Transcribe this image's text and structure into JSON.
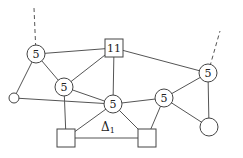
{
  "diagram": {
    "type": "planar-graph",
    "nodes": [
      {
        "id": "n_tl",
        "shape": "circle",
        "size": "labeled",
        "label": "5"
      },
      {
        "id": "n_top",
        "shape": "square",
        "size": "labeled",
        "label": "11"
      },
      {
        "id": "n_fl",
        "shape": "circle",
        "size": "small",
        "label": ""
      },
      {
        "id": "n_lm",
        "shape": "circle",
        "size": "labeled",
        "label": "5"
      },
      {
        "id": "n_c",
        "shape": "circle",
        "size": "labeled",
        "label": "5"
      },
      {
        "id": "n_rc",
        "shape": "circle",
        "size": "labeled",
        "label": "5"
      },
      {
        "id": "n_fr",
        "shape": "circle",
        "size": "labeled",
        "label": "5"
      },
      {
        "id": "n_br",
        "shape": "circle",
        "size": "large",
        "label": ""
      },
      {
        "id": "n_bl",
        "shape": "square",
        "size": "large",
        "label": ""
      },
      {
        "id": "n_bm",
        "shape": "square",
        "size": "large",
        "label": ""
      }
    ],
    "edges": [
      {
        "from": "n_tl",
        "to": "n_top",
        "style": "solid"
      },
      {
        "from": "n_tl",
        "to": "n_fl",
        "style": "solid"
      },
      {
        "from": "n_tl",
        "to": "n_lm",
        "style": "solid"
      },
      {
        "from": "n_top",
        "to": "n_lm",
        "style": "solid"
      },
      {
        "from": "n_top",
        "to": "n_c",
        "style": "solid"
      },
      {
        "from": "n_top",
        "to": "n_fr",
        "style": "solid"
      },
      {
        "from": "n_fl",
        "to": "n_c",
        "style": "solid"
      },
      {
        "from": "n_lm",
        "to": "n_c",
        "style": "solid"
      },
      {
        "from": "n_lm",
        "to": "n_bl",
        "style": "solid"
      },
      {
        "from": "n_c",
        "to": "n_rc",
        "style": "solid"
      },
      {
        "from": "n_c",
        "to": "n_bl",
        "style": "solid"
      },
      {
        "from": "n_c",
        "to": "n_bm",
        "style": "solid"
      },
      {
        "from": "n_rc",
        "to": "n_fr",
        "style": "solid"
      },
      {
        "from": "n_rc",
        "to": "n_br",
        "style": "solid"
      },
      {
        "from": "n_rc",
        "to": "n_bm",
        "style": "solid"
      },
      {
        "from": "n_fr",
        "to": "n_br",
        "style": "solid"
      },
      {
        "from": "n_bl",
        "to": "n_bm",
        "style": "solid"
      }
    ],
    "dangling_edges": [
      {
        "from": "n_tl",
        "direction": "up",
        "style": "dashed"
      },
      {
        "from": "n_fr",
        "direction": "up-right",
        "style": "dashed"
      }
    ],
    "region_label": {
      "symbol": "Δ",
      "subscript": "1"
    }
  }
}
